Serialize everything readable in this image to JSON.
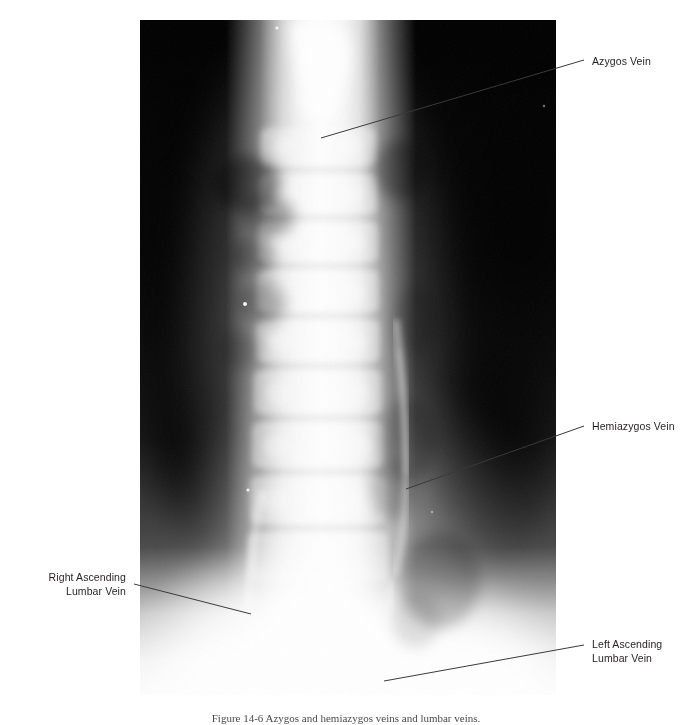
{
  "figure": {
    "type": "radiograph",
    "modality": "Venogram / contrast radiograph",
    "view": "Anteroposterior thoracolumbar spine",
    "caption": "Figure 14-6  Azygos and hemiazygos veins and lumbar veins."
  },
  "annotations": [
    {
      "id": "azygos",
      "label": "Azygos Vein",
      "side": "right",
      "leader": {
        "x1": 584,
        "y1": 60,
        "x2": 321,
        "y2": 138
      }
    },
    {
      "id": "hemiazygos",
      "label": "Hemiazygos Vein",
      "side": "right",
      "leader": {
        "x1": 584,
        "y1": 426,
        "x2": 406,
        "y2": 489
      }
    },
    {
      "id": "right-ascending-lumbar",
      "label": "Right Ascending\nLumbar Vein",
      "side": "left",
      "leader": {
        "x1": 134,
        "y1": 584,
        "x2": 251,
        "y2": 614
      }
    },
    {
      "id": "left-ascending-lumbar",
      "label": "Left Ascending\nLumbar Vein",
      "side": "right",
      "leader": {
        "x1": 584,
        "y1": 645,
        "x2": 384,
        "y2": 681
      }
    }
  ],
  "colors": {
    "page_background": "#ffffff",
    "label_text": "#231f20",
    "leader_line": "#3a3a3a",
    "plate_dark": "#050505",
    "contrast_bright": "#fbfbfb"
  },
  "plate": {
    "left": 140,
    "top": 20,
    "width": 416,
    "height": 675
  }
}
